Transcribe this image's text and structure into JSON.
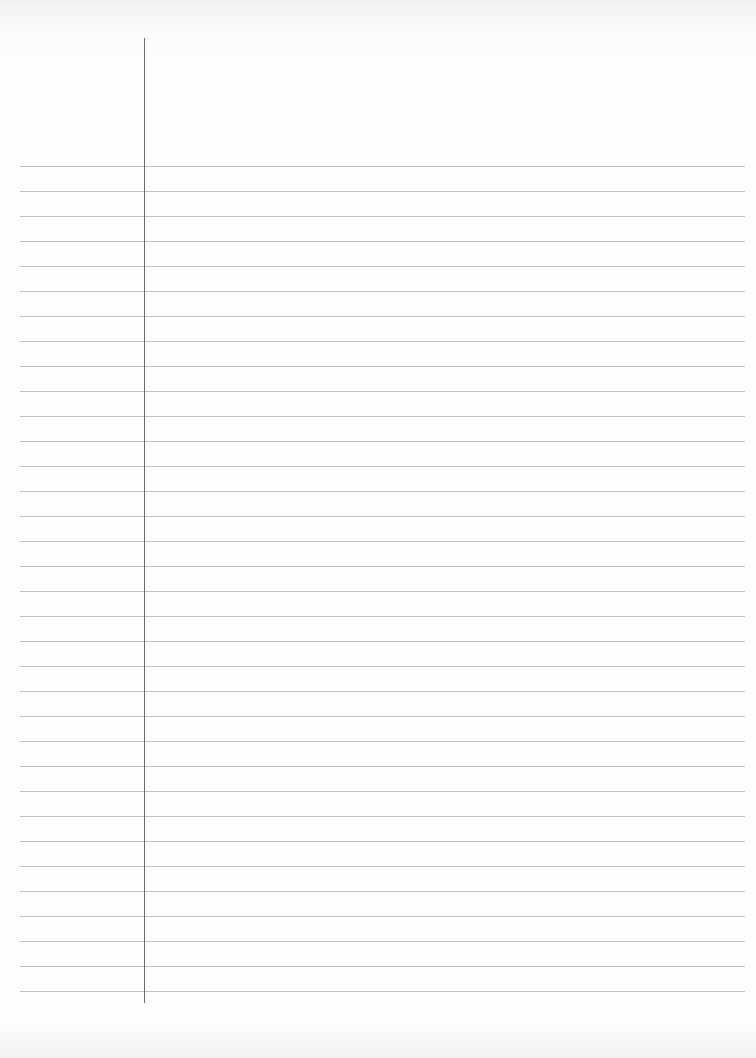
{
  "page": {
    "type": "blank lined paper",
    "text_content": ""
  },
  "layout": {
    "margin_line": {
      "x": 144,
      "top": 38,
      "bottom": 1003,
      "color": "#6e6e6e"
    },
    "rules": {
      "first_y": 166,
      "spacing": 25,
      "count": 34,
      "left": 20,
      "right": 745,
      "color": "#b9b9b9"
    }
  }
}
